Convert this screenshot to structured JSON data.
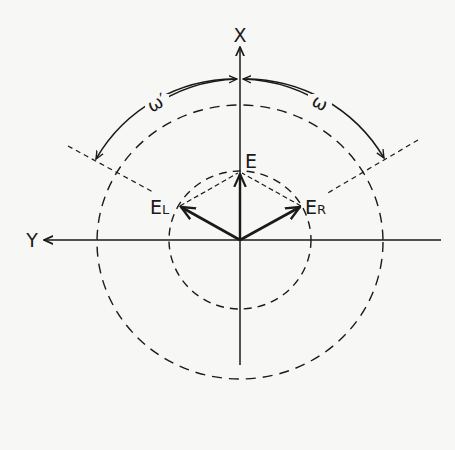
{
  "diagram": {
    "axes": {
      "x_label": "X",
      "y_label": "Y"
    },
    "vectors": {
      "e_label": "E",
      "el_label": "E",
      "el_sub": "L",
      "er_label": "E",
      "er_sub": "R"
    },
    "angles": {
      "omega_prime": "ω′",
      "omega": "ω"
    },
    "colors": {
      "background": "#f7f7f5",
      "ink": "#1a1a1a"
    }
  }
}
